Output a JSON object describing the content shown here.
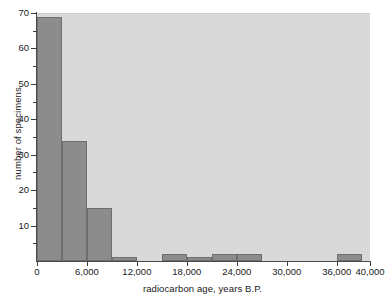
{
  "chart_data": {
    "type": "bar",
    "title": "",
    "xlabel": "radiocarbon age, years B.P.",
    "ylabel": "number of specimens",
    "xlim": [
      0,
      40000
    ],
    "ylim": [
      0,
      70
    ],
    "bin_width": 3000,
    "grid": false,
    "legend": null,
    "bar_color": "#8c8c8c",
    "bar_edge_color": "#6e6e6e",
    "plot_background": "#d9d9d9",
    "figure_background": "#ffffff",
    "axis_color": "#3a3a3a",
    "text_color": "#1a1a1a",
    "categories": [
      "0-3,000",
      "3,000-6,000",
      "6,000-9,000",
      "9,000-12,000",
      "12,000-15,000",
      "15,000-18,000",
      "18,000-21,000",
      "21,000-24,000",
      "24,000-27,000",
      "27,000-30,000",
      "30,000-33,000",
      "33,000-36,000",
      "36,000-39,000"
    ],
    "bin_starts": [
      0,
      3000,
      6000,
      9000,
      12000,
      15000,
      18000,
      21000,
      24000,
      27000,
      30000,
      33000,
      36000
    ],
    "values": [
      69,
      34,
      15,
      1,
      0,
      2,
      1,
      2,
      2,
      0,
      0,
      0,
      2
    ],
    "x_ticks": [
      0,
      6000,
      12000,
      18000,
      24000,
      30000,
      36000,
      40000
    ],
    "x_tick_labels": [
      "0",
      "6,000",
      "12,000",
      "18,000",
      "24,000",
      "30,000",
      "36,000",
      "40,000"
    ],
    "y_ticks_major": [
      10,
      20,
      30,
      40,
      50,
      60,
      70
    ],
    "y_tick_labels": [
      "10",
      "20",
      "30",
      "40",
      "50",
      "60",
      "70"
    ],
    "y_ticks_minor": [
      5,
      15,
      25,
      35,
      45,
      55,
      65
    ]
  }
}
